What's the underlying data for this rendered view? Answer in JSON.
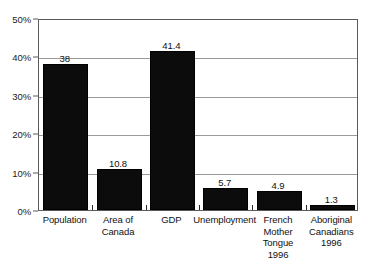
{
  "chart_data": {
    "type": "bar",
    "title": "",
    "subtitle": "",
    "xlabel": "",
    "ylabel": "",
    "categories": [
      "Population",
      "Area of\nCanada",
      "GDP",
      "Unemployment",
      "French\nMother\nTongue\n1996",
      "Aboriginal\nCanadians\n1996"
    ],
    "category_lines": [
      [
        "Population"
      ],
      [
        "Area of",
        "Canada"
      ],
      [
        "GDP"
      ],
      [
        "Unemployment"
      ],
      [
        "French",
        "Mother",
        "Tongue",
        "1996"
      ],
      [
        "Aboriginal",
        "Canadians",
        "1996"
      ]
    ],
    "values": [
      38,
      10.8,
      41.4,
      5.7,
      4.9,
      1.3
    ],
    "value_labels": [
      "38",
      "10.8",
      "41.4",
      "5.7",
      "4.9",
      "1.3"
    ],
    "ylim": [
      0,
      50
    ],
    "yticks": [
      0,
      10,
      20,
      30,
      40,
      50
    ],
    "ytick_labels": [
      "0%",
      "10%",
      "20%",
      "30%",
      "40%",
      "50%"
    ],
    "grid": true,
    "grid_axis": "y",
    "legend": false,
    "legend_position": "none",
    "bar_color": "#0c0c0c",
    "grid_color": "#9a9a9a",
    "axis_color": "#5a5a5a",
    "background_color": "#ffffff",
    "text_color": "#111111"
  }
}
